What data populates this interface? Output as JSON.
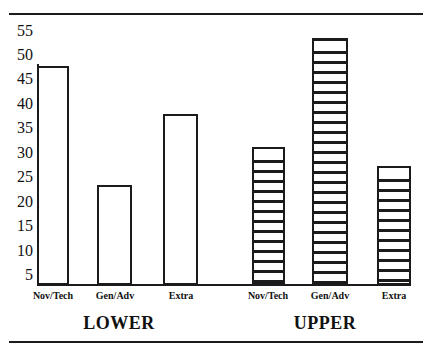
{
  "chart_data": {
    "type": "bar",
    "title": "",
    "subtitle": "",
    "xlabel": "",
    "ylabel": "",
    "ylim": [
      0,
      57
    ],
    "yticks": [
      55,
      50,
      45,
      40,
      35,
      30,
      25,
      20,
      15,
      10,
      5
    ],
    "grid": false,
    "legend": null,
    "categories": [
      "Nov/Tech",
      "Gen/Adv",
      "Extra"
    ],
    "groups": [
      "LOWER",
      "UPPER"
    ],
    "series": [
      {
        "name": "LOWER",
        "fill": "solid-white",
        "values": [
          46,
          21,
          36
        ]
      },
      {
        "name": "UPPER",
        "fill": "horizontal-hatch",
        "values": [
          29,
          52,
          25
        ]
      }
    ],
    "bars": [
      {
        "group": "LOWER",
        "category": "Nov/Tech",
        "value": 46,
        "fill": "solid-white"
      },
      {
        "group": "LOWER",
        "category": "Gen/Adv",
        "value": 21,
        "fill": "solid-white"
      },
      {
        "group": "LOWER",
        "category": "Extra",
        "value": 36,
        "fill": "solid-white"
      },
      {
        "group": "UPPER",
        "category": "Nov/Tech",
        "value": 29,
        "fill": "horizontal-hatch"
      },
      {
        "group": "UPPER",
        "category": "Gen/Adv",
        "value": 52,
        "fill": "horizontal-hatch"
      },
      {
        "group": "UPPER",
        "category": "Extra",
        "value": 25,
        "fill": "horizontal-hatch"
      }
    ]
  },
  "axis": {
    "ytick_0": "55",
    "ytick_1": "50",
    "ytick_2": "45",
    "ytick_3": "40",
    "ytick_4": "35",
    "ytick_5": "30",
    "ytick_6": "25",
    "ytick_7": "20",
    "ytick_8": "15",
    "ytick_9": "10",
    "ytick_10": "5"
  },
  "labels": {
    "cat_lower_0": "Nov/Tech",
    "cat_lower_1": "Gen/Adv",
    "cat_lower_2": "Extra",
    "cat_upper_0": "Nov/Tech",
    "cat_upper_1": "Gen/Adv",
    "cat_upper_2": "Extra",
    "group_lower": "LOWER",
    "group_upper": "UPPER"
  },
  "colors": {
    "ink": "#1b1b1b",
    "paper": "#ffffff"
  }
}
